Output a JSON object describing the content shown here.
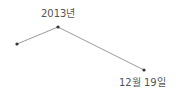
{
  "diagram": {
    "points": [
      {
        "x": 17,
        "y": 44
      },
      {
        "x": 58,
        "y": 27
      },
      {
        "x": 144,
        "y": 70
      }
    ],
    "labels": {
      "top": "2013년",
      "bottom": "12월 19일"
    },
    "colors": {
      "line": "#999999",
      "point": "#333333",
      "text": "#555555"
    }
  }
}
